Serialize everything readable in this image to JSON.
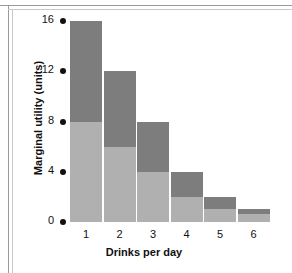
{
  "chart_data": {
    "type": "bar",
    "stacked": true,
    "title": "",
    "xlabel": "Drinks per day",
    "ylabel": "Marginal utility (units)",
    "categories": [
      "1",
      "2",
      "3",
      "4",
      "5",
      "6"
    ],
    "ylim": [
      0,
      16
    ],
    "yticks": [
      0,
      4,
      8,
      12,
      16
    ],
    "ytick_labels": [
      "0",
      "4",
      "8",
      "12",
      "16"
    ],
    "grid": false,
    "legend": "none",
    "series": [
      {
        "name": "lower",
        "color": "#b0b0b0",
        "values": [
          8,
          6,
          4,
          2,
          1,
          0.6
        ]
      },
      {
        "name": "upper",
        "color": "#7d7d7d",
        "values": [
          8,
          6,
          4,
          2,
          1,
          0.4
        ]
      }
    ],
    "totals": [
      16,
      12,
      8,
      4,
      2,
      1
    ]
  },
  "colors": {
    "bar_light": "#b0b0b0",
    "bar_dark": "#7d7d7d",
    "text": "#111111",
    "frame": "#9a9a9a",
    "background": "#ffffff"
  }
}
